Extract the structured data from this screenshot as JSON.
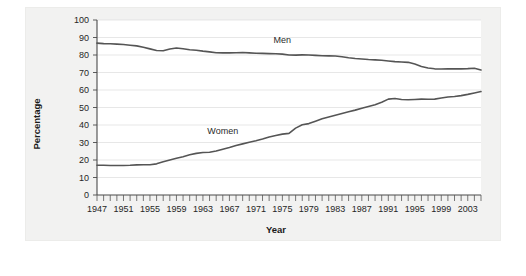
{
  "figure": {
    "background_color": "#ffffff",
    "panel_color": "#f2f2f1",
    "plot_area_color": "#ffffff"
  },
  "chart_data": {
    "type": "line",
    "title": "",
    "subtitle": "",
    "xlabel": "Year",
    "ylabel": "Percentage",
    "xlim": [
      1947,
      2005
    ],
    "ylim": [
      0,
      100
    ],
    "grid": true,
    "legend_position": "inline-annotations",
    "line_color": "#555555",
    "x_tick_labels": [
      "1947",
      "1951",
      "1955",
      "1959",
      "1963",
      "1967",
      "1971",
      "1975",
      "1979",
      "1983",
      "1987",
      "1991",
      "1995",
      "1999",
      "2003"
    ],
    "x_tick_values": [
      1947,
      1951,
      1955,
      1959,
      1963,
      1967,
      1971,
      1975,
      1979,
      1983,
      1987,
      1991,
      1995,
      1999,
      2003
    ],
    "x_minor_tick_step": 1,
    "y_tick_labels": [
      "0",
      "10",
      "20",
      "30",
      "40",
      "50",
      "60",
      "70",
      "80",
      "90",
      "100"
    ],
    "y_tick_values": [
      0,
      10,
      20,
      30,
      40,
      50,
      60,
      70,
      80,
      90,
      100
    ],
    "x": [
      1947,
      1948,
      1949,
      1950,
      1951,
      1952,
      1953,
      1954,
      1955,
      1956,
      1957,
      1958,
      1959,
      1960,
      1961,
      1962,
      1963,
      1964,
      1965,
      1966,
      1967,
      1968,
      1969,
      1970,
      1971,
      1972,
      1973,
      1974,
      1975,
      1976,
      1977,
      1978,
      1979,
      1980,
      1981,
      1982,
      1983,
      1984,
      1985,
      1986,
      1987,
      1988,
      1989,
      1990,
      1991,
      1992,
      1993,
      1994,
      1995,
      1996,
      1997,
      1998,
      1999,
      2000,
      2001,
      2002,
      2003,
      2004,
      2005
    ],
    "series": [
      {
        "name": "Men",
        "label": "Men",
        "label_x": 1975,
        "label_y": 87,
        "color": "#555555",
        "values": [
          86.8,
          86.6,
          86.4,
          86.4,
          86.3,
          86.3,
          86.0,
          85.5,
          85.4,
          85.5,
          84.3,
          84.0,
          83.7,
          83.3,
          82.9,
          82.0,
          81.4,
          81.0,
          80.7,
          80.4,
          80.4,
          80.1,
          79.8,
          79.7,
          79.1,
          79.0,
          78.8,
          78.7,
          77.9,
          77.5,
          77.7,
          77.9,
          77.8,
          77.4,
          77.0,
          76.6,
          76.4,
          76.4,
          76.3,
          76.3,
          76.2,
          76.2,
          76.4,
          76.4,
          75.8,
          75.8,
          75.4,
          75.1,
          75.0,
          74.9,
          75.0,
          74.9,
          74.7,
          74.8,
          74.4,
          74.1,
          73.5,
          73.3,
          73.3
        ]
      },
      {
        "name": "Women",
        "label": "Women",
        "label_x": 1966,
        "label_y": 35,
        "color": "#555555",
        "values": [
          31.8,
          32.7,
          33.1,
          33.9,
          34.6,
          34.7,
          34.4,
          34.6,
          35.7,
          36.9,
          36.9,
          37.1,
          37.1,
          37.7,
          38.1,
          37.9,
          38.3,
          38.7,
          39.3,
          40.3,
          41.1,
          41.6,
          42.7,
          43.3,
          43.4,
          43.9,
          44.7,
          45.7,
          46.3,
          47.3,
          48.4,
          50.0,
          50.9,
          51.5,
          52.1,
          52.6,
          52.9,
          53.6,
          54.5,
          55.3,
          56.0,
          56.6,
          57.4,
          57.5,
          57.4,
          57.8,
          57.9,
          58.8,
          58.9,
          59.3,
          59.8,
          59.8,
          60.0,
          59.9,
          59.8,
          59.6,
          59.5,
          59.2,
          59.3
        ]
      }
    ],
    "series_display": [
      {
        "name": "Men",
        "points": [
          [
            1947,
            86.8
          ],
          [
            1948,
            86.5
          ],
          [
            1949,
            86.4
          ],
          [
            1950,
            86.2
          ],
          [
            1951,
            86.0
          ],
          [
            1952,
            85.6
          ],
          [
            1953,
            85.2
          ],
          [
            1954,
            84.4
          ],
          [
            1955,
            83.5
          ],
          [
            1956,
            82.6
          ],
          [
            1957,
            82.4
          ],
          [
            1958,
            83.4
          ],
          [
            1959,
            84.0
          ],
          [
            1960,
            83.6
          ],
          [
            1961,
            83.0
          ],
          [
            1962,
            82.7
          ],
          [
            1963,
            82.2
          ],
          [
            1964,
            81.8
          ],
          [
            1965,
            81.3
          ],
          [
            1966,
            81.2
          ],
          [
            1967,
            81.2
          ],
          [
            1968,
            81.3
          ],
          [
            1969,
            81.4
          ],
          [
            1970,
            81.2
          ],
          [
            1971,
            81.0
          ],
          [
            1972,
            80.9
          ],
          [
            1973,
            80.8
          ],
          [
            1974,
            80.7
          ],
          [
            1975,
            80.5
          ],
          [
            1976,
            80.0
          ],
          [
            1977,
            79.9
          ],
          [
            1978,
            80.1
          ],
          [
            1979,
            80.0
          ],
          [
            1980,
            79.8
          ],
          [
            1981,
            79.6
          ],
          [
            1982,
            79.5
          ],
          [
            1983,
            79.4
          ],
          [
            1984,
            79.0
          ],
          [
            1985,
            78.4
          ],
          [
            1986,
            78.0
          ],
          [
            1987,
            77.7
          ],
          [
            1988,
            77.4
          ],
          [
            1989,
            77.2
          ],
          [
            1990,
            77.0
          ],
          [
            1991,
            76.6
          ],
          [
            1992,
            76.2
          ],
          [
            1993,
            76.0
          ],
          [
            1994,
            75.8
          ],
          [
            1995,
            74.8
          ],
          [
            1996,
            73.4
          ],
          [
            1997,
            72.6
          ],
          [
            1998,
            72.1
          ],
          [
            1999,
            72.0
          ],
          [
            2000,
            72.1
          ],
          [
            2001,
            72.1
          ],
          [
            2002,
            72.1
          ],
          [
            2003,
            72.2
          ],
          [
            2004,
            72.4
          ],
          [
            2005,
            71.4
          ]
        ],
        "note": "Labour force participation rate, men, gradual decline 87 to 71"
      },
      {
        "name": "Women",
        "points": [
          [
            1947,
            17.0
          ],
          [
            1948,
            17.0
          ],
          [
            1949,
            16.9
          ],
          [
            1950,
            16.9
          ],
          [
            1951,
            16.9
          ],
          [
            1952,
            17.0
          ],
          [
            1953,
            17.2
          ],
          [
            1954,
            17.3
          ],
          [
            1955,
            17.3
          ],
          [
            1956,
            17.8
          ],
          [
            1957,
            19.0
          ],
          [
            1958,
            20.0
          ],
          [
            1959,
            21.0
          ],
          [
            1960,
            21.9
          ],
          [
            1961,
            23.0
          ],
          [
            1962,
            23.8
          ],
          [
            1963,
            24.3
          ],
          [
            1964,
            24.4
          ],
          [
            1965,
            25.1
          ],
          [
            1966,
            26.2
          ],
          [
            1967,
            27.2
          ],
          [
            1968,
            28.3
          ],
          [
            1969,
            29.2
          ],
          [
            1970,
            30.1
          ],
          [
            1971,
            31.0
          ],
          [
            1972,
            32.0
          ],
          [
            1973,
            33.1
          ],
          [
            1974,
            34.0
          ],
          [
            1975,
            34.8
          ],
          [
            1976,
            35.2
          ],
          [
            1977,
            38.2
          ],
          [
            1978,
            40.1
          ],
          [
            1979,
            40.8
          ],
          [
            1980,
            42.2
          ],
          [
            1981,
            43.6
          ],
          [
            1982,
            44.6
          ],
          [
            1983,
            45.6
          ],
          [
            1984,
            46.6
          ],
          [
            1985,
            47.6
          ],
          [
            1986,
            48.5
          ],
          [
            1987,
            49.6
          ],
          [
            1988,
            50.6
          ],
          [
            1989,
            51.6
          ],
          [
            1990,
            53.0
          ],
          [
            1991,
            54.8
          ],
          [
            1992,
            55.1
          ],
          [
            1993,
            54.6
          ],
          [
            1994,
            54.4
          ],
          [
            1995,
            54.6
          ],
          [
            1996,
            54.8
          ],
          [
            1997,
            54.7
          ],
          [
            1998,
            54.8
          ],
          [
            1999,
            55.4
          ],
          [
            2000,
            56.0
          ],
          [
            2001,
            56.3
          ],
          [
            2002,
            56.8
          ],
          [
            2003,
            57.5
          ],
          [
            2004,
            58.3
          ],
          [
            2005,
            59.1
          ]
        ],
        "note": "Labour force participation rate, women, rising 17 to 59"
      }
    ]
  }
}
